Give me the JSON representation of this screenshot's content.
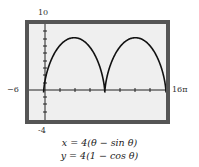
{
  "chart_data": {
    "type": "line",
    "title": "",
    "xlabel": "",
    "ylabel": "",
    "xlim": [
      "-6",
      "16π"
    ],
    "ylim": [
      -4,
      10
    ],
    "grid": false,
    "legend": [],
    "parametric": {
      "x": "4(θ − sin θ)",
      "y": "4(1 − cos θ)",
      "theta_range": [
        0,
        "4π"
      ]
    },
    "series": [
      {
        "name": "cycloid",
        "points": [
          {
            "x": 0,
            "y": 0
          },
          {
            "x": 12.57,
            "y": 8
          },
          {
            "x": 25.13,
            "y": 0
          },
          {
            "x": 37.7,
            "y": 8
          },
          {
            "x": 50.27,
            "y": 0
          }
        ]
      }
    ],
    "tick_labels": {
      "xmin": "-6",
      "xmax": "16π",
      "ymin": "-4",
      "ymax": "10"
    }
  },
  "labels": {
    "ymax": "10",
    "ymin": "-4",
    "xmin": "−6",
    "xmax": "16π"
  },
  "equations": {
    "line1": "x = 4(θ − sin θ)",
    "line2": "y = 4(1 − cos θ)"
  },
  "colors": {
    "frame": "#555555",
    "plot_bg": "#efefef",
    "curve": "#111111"
  }
}
